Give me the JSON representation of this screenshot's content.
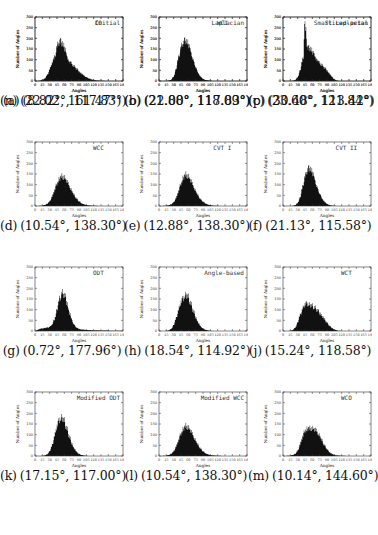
{
  "figure": {
    "axis": {
      "xlabel": "Angles",
      "ylabel": "Number of Angles",
      "xticks": [
        0,
        15,
        30,
        45,
        60,
        75,
        90,
        105,
        120,
        135,
        150,
        165,
        180
      ],
      "yticks": [
        0,
        50,
        100,
        150,
        200,
        250,
        300
      ],
      "xlim": [
        0,
        180
      ],
      "ylim": [
        0,
        300
      ]
    }
  },
  "chart_data": [
    {
      "type": "bar",
      "panel": "a",
      "title": "Initial",
      "caption": "(8.82°, 161.47°)",
      "label": "(a)",
      "values_text": "(8.82°, 161.47°)",
      "xlabel": "Angles",
      "ylabel": "Number of Angles",
      "xlim": [
        0,
        180
      ],
      "ylim": [
        0,
        300
      ],
      "x": [
        5,
        10,
        15,
        20,
        25,
        30,
        35,
        40,
        45,
        50,
        55,
        60,
        65,
        70,
        75,
        80,
        85,
        90,
        95,
        100,
        105,
        110,
        115,
        120,
        125,
        130,
        135,
        140,
        145,
        150,
        155,
        160
      ],
      "values": [
        0,
        2,
        5,
        12,
        28,
        55,
        85,
        105,
        118,
        120,
        115,
        110,
        100,
        92,
        82,
        70,
        58,
        45,
        35,
        26,
        18,
        12,
        8,
        5,
        3,
        2,
        1,
        1,
        0,
        0,
        0,
        0
      ]
    },
    {
      "type": "bar",
      "panel": "b",
      "title": "Laplacian",
      "caption": "(22.00°, 117.83°)",
      "label": "(b)",
      "xlabel": "Angles",
      "ylabel": "Number of Angles",
      "xlim": [
        0,
        180
      ],
      "ylim": [
        0,
        300
      ],
      "x": [
        20,
        25,
        30,
        35,
        40,
        45,
        50,
        55,
        60,
        65,
        70,
        75,
        80,
        85,
        90,
        95,
        100,
        105,
        110,
        115
      ],
      "values": [
        1,
        6,
        20,
        55,
        110,
        160,
        180,
        190,
        175,
        140,
        100,
        65,
        38,
        20,
        10,
        5,
        2,
        1,
        0,
        0
      ]
    },
    {
      "type": "bar",
      "panel": "c",
      "title": "Smart Laplacian",
      "caption": "(23.60°, 121.84°)",
      "label": "(c)",
      "xlabel": "Angles",
      "ylabel": "Number of Angles",
      "xlim": [
        0,
        180
      ],
      "ylim": [
        0,
        300
      ],
      "x": [
        20,
        25,
        30,
        35,
        40,
        45,
        50,
        55,
        60,
        65,
        70,
        75,
        80,
        85,
        90,
        95,
        100,
        105,
        110,
        115,
        120
      ],
      "values": [
        1,
        5,
        18,
        50,
        100,
        140,
        150,
        155,
        140,
        118,
        95,
        72,
        52,
        35,
        22,
        12,
        6,
        3,
        1,
        0,
        0
      ]
    },
    {
      "type": "bar",
      "panel": "d",
      "title": "WCC",
      "caption": "(10.54°, 138.30°)",
      "label": "(d)",
      "xlabel": "Angles",
      "ylabel": "Number of Angles",
      "xlim": [
        0,
        180
      ],
      "ylim": [
        0,
        300
      ],
      "x": [
        10,
        15,
        20,
        25,
        30,
        35,
        40,
        45,
        50,
        55,
        60,
        65,
        70,
        75,
        80,
        85,
        90,
        95,
        100,
        105,
        110,
        115,
        120,
        125,
        130,
        135
      ],
      "values": [
        1,
        2,
        5,
        10,
        22,
        45,
        75,
        105,
        128,
        140,
        135,
        118,
        95,
        72,
        52,
        35,
        22,
        13,
        8,
        5,
        3,
        2,
        1,
        1,
        0,
        0
      ]
    },
    {
      "type": "bar",
      "panel": "e",
      "title": "CVT I",
      "caption": "(12.88°, 138.30°)",
      "label": "(e)",
      "xlabel": "Angles",
      "ylabel": "Number of Angles",
      "xlim": [
        0,
        180
      ],
      "ylim": [
        0,
        300
      ],
      "x": [
        10,
        15,
        20,
        25,
        30,
        35,
        40,
        45,
        50,
        55,
        60,
        65,
        70,
        75,
        80,
        85,
        90,
        95,
        100,
        105,
        110,
        115,
        120,
        125,
        130,
        135
      ],
      "values": [
        1,
        2,
        4,
        8,
        18,
        38,
        70,
        105,
        135,
        148,
        140,
        120,
        95,
        70,
        50,
        32,
        20,
        12,
        7,
        4,
        2,
        1,
        1,
        0,
        0,
        0
      ]
    },
    {
      "type": "bar",
      "panel": "f",
      "title": "CVT II",
      "caption": "(21.13°, 115.58°)",
      "label": "(f)",
      "xlabel": "Angles",
      "ylabel": "Number of Angles",
      "xlim": [
        0,
        180
      ],
      "ylim": [
        0,
        300
      ],
      "x": [
        20,
        25,
        30,
        35,
        40,
        45,
        50,
        55,
        60,
        65,
        70,
        75,
        80,
        85,
        90,
        95,
        100,
        105,
        110,
        115
      ],
      "values": [
        1,
        4,
        14,
        40,
        90,
        140,
        168,
        178,
        160,
        125,
        88,
        58,
        35,
        20,
        10,
        5,
        2,
        1,
        0,
        0
      ]
    },
    {
      "type": "bar",
      "panel": "g",
      "title": "ODT",
      "caption": "(0.72°, 177.96°)",
      "label": "(g)",
      "xlabel": "Angles",
      "ylabel": "Number of Angles",
      "xlim": [
        0,
        180
      ],
      "ylim": [
        0,
        300
      ],
      "x": [
        5,
        10,
        15,
        20,
        25,
        30,
        35,
        40,
        45,
        50,
        55,
        60,
        65,
        70,
        75,
        80,
        85,
        90,
        95,
        100,
        105,
        110,
        115,
        120,
        125,
        130,
        135,
        140,
        145,
        150,
        155,
        160,
        165,
        170,
        175
      ],
      "values": [
        5,
        10,
        12,
        14,
        16,
        20,
        30,
        55,
        100,
        150,
        180,
        170,
        135,
        90,
        55,
        30,
        16,
        10,
        7,
        6,
        5,
        4,
        4,
        3,
        3,
        3,
        2,
        2,
        2,
        2,
        1,
        1,
        1,
        1,
        1
      ]
    },
    {
      "type": "bar",
      "panel": "h",
      "title": "Angle-based",
      "caption": "(18.54°, 114.92°)",
      "label": "(h)",
      "xlabel": "Angles",
      "ylabel": "Number of Angles",
      "xlim": [
        0,
        180
      ],
      "ylim": [
        0,
        300
      ],
      "x": [
        15,
        20,
        25,
        30,
        35,
        40,
        45,
        50,
        55,
        60,
        65,
        70,
        75,
        80,
        85,
        90,
        95,
        100,
        105,
        110,
        115
      ],
      "values": [
        1,
        3,
        10,
        28,
        60,
        100,
        135,
        155,
        170,
        160,
        130,
        95,
        65,
        40,
        22,
        12,
        6,
        3,
        1,
        0,
        0
      ]
    },
    {
      "type": "bar",
      "panel": "i",
      "title": "WCT",
      "caption": "(15.24°, 118.58°)",
      "label": "(j)",
      "xlabel": "Angles",
      "ylabel": "Number of Angles",
      "xlim": [
        0,
        180
      ],
      "ylim": [
        0,
        300
      ],
      "x": [
        15,
        20,
        25,
        30,
        35,
        40,
        45,
        50,
        55,
        60,
        65,
        70,
        75,
        80,
        85,
        90,
        95,
        100,
        105,
        110,
        115
      ],
      "values": [
        1,
        5,
        15,
        40,
        75,
        105,
        125,
        128,
        122,
        118,
        110,
        98,
        85,
        70,
        55,
        40,
        25,
        14,
        7,
        3,
        1
      ]
    },
    {
      "type": "bar",
      "panel": "k",
      "title": "Modified ODT",
      "caption": "(17.15°, 117.00°)",
      "label": "(k)",
      "xlabel": "Angles",
      "ylabel": "Number of Angles",
      "xlim": [
        0,
        180
      ],
      "ylim": [
        0,
        300
      ],
      "x": [
        15,
        20,
        25,
        30,
        35,
        40,
        45,
        50,
        55,
        60,
        65,
        70,
        75,
        80,
        85,
        90,
        95,
        100,
        105,
        110,
        115
      ],
      "values": [
        1,
        3,
        8,
        22,
        50,
        95,
        140,
        170,
        180,
        165,
        130,
        92,
        60,
        36,
        20,
        10,
        5,
        2,
        1,
        0,
        0
      ]
    },
    {
      "type": "bar",
      "panel": "l",
      "title": "Modified WCC",
      "caption": "(10.54°, 138.30°)",
      "label": "(l)",
      "xlabel": "Angles",
      "ylabel": "Number of Angles",
      "xlim": [
        0,
        180
      ],
      "ylim": [
        0,
        300
      ],
      "x": [
        10,
        15,
        20,
        25,
        30,
        35,
        40,
        45,
        50,
        55,
        60,
        65,
        70,
        75,
        80,
        85,
        90,
        95,
        100,
        105,
        110,
        115,
        120,
        125,
        130,
        135
      ],
      "values": [
        1,
        2,
        5,
        10,
        22,
        45,
        75,
        105,
        128,
        142,
        135,
        118,
        95,
        72,
        52,
        35,
        22,
        13,
        8,
        5,
        3,
        2,
        1,
        1,
        0,
        0
      ]
    },
    {
      "type": "bar",
      "panel": "m",
      "title": "WCO",
      "caption": "(10.14°, 144.60°)",
      "label": "(m)",
      "xlabel": "Angles",
      "ylabel": "Number of Angles",
      "xlim": [
        0,
        180
      ],
      "ylim": [
        0,
        300
      ],
      "x": [
        10,
        15,
        20,
        25,
        30,
        35,
        40,
        45,
        50,
        55,
        60,
        65,
        70,
        75,
        80,
        85,
        90,
        95,
        100,
        105,
        110,
        115,
        120,
        125,
        130,
        135,
        140
      ],
      "values": [
        1,
        2,
        5,
        10,
        25,
        55,
        90,
        118,
        128,
        130,
        130,
        125,
        112,
        95,
        72,
        50,
        32,
        18,
        10,
        5,
        3,
        2,
        1,
        1,
        0,
        0,
        0
      ]
    },
    {
      "type": "bar",
      "panel": "n",
      "title": "CO",
      "caption": "(22.02°, 117.83°)",
      "label": "(n)",
      "xlabel": "Angles",
      "ylabel": "Number of Angles",
      "xlim": [
        0,
        180
      ],
      "ylim": [
        0,
        300
      ],
      "x": [
        20,
        25,
        30,
        35,
        40,
        45,
        50,
        55,
        60,
        65,
        70,
        75,
        80,
        85,
        90,
        95,
        100,
        105,
        110,
        115
      ],
      "values": [
        1,
        6,
        20,
        55,
        110,
        165,
        185,
        180,
        160,
        120,
        85,
        55,
        32,
        18,
        9,
        4,
        2,
        1,
        0,
        0
      ]
    },
    {
      "type": "bar",
      "panel": "o",
      "title": "WCI",
      "caption": "(21.88°, 118.09°)",
      "label": "(o)",
      "xlabel": "Angles",
      "ylabel": "Number of Angles",
      "xlim": [
        0,
        180
      ],
      "ylim": [
        0,
        300
      ],
      "x": [
        20,
        25,
        30,
        35,
        40,
        45,
        50,
        55,
        60,
        65,
        70,
        75,
        80,
        85,
        90,
        95,
        100,
        105,
        110,
        115
      ],
      "values": [
        1,
        5,
        18,
        50,
        100,
        145,
        165,
        170,
        155,
        120,
        85,
        55,
        32,
        18,
        9,
        4,
        2,
        1,
        0,
        0
      ]
    },
    {
      "type": "bar",
      "panel": "p",
      "title": "Sliced-petal",
      "caption": "(30.48°, 113.42°)",
      "label": "(p)",
      "xlabel": "Angles",
      "ylabel": "Number of Angles",
      "xlim": [
        0,
        180
      ],
      "ylim": [
        0,
        300
      ],
      "x": [
        30,
        35,
        40,
        45,
        50,
        55,
        60,
        65,
        70,
        75,
        80,
        85,
        90,
        95,
        100,
        105,
        110,
        115
      ],
      "values": [
        2,
        10,
        35,
        280,
        150,
        120,
        110,
        105,
        95,
        85,
        75,
        62,
        50,
        35,
        20,
        8,
        2,
        0
      ]
    }
  ],
  "panels": [
    {
      "label": "(a)",
      "values": "(8.82°, 161.47°)"
    },
    {
      "label": "(b)",
      "values": "(22.00°, 117.83°)"
    },
    {
      "label": "(c)",
      "values": "(23.60°, 121.84°)"
    },
    {
      "label": "(d)",
      "values": "(10.54°, 138.30°)"
    },
    {
      "label": "(e)",
      "values": "(12.88°, 138.30°)"
    },
    {
      "label": "(f)",
      "values": "(21.13°, 115.58°)"
    },
    {
      "label": "(g)",
      "values": "(0.72°, 177.96°)"
    },
    {
      "label": "(h)",
      "values": "(18.54°, 114.92°)"
    },
    {
      "label": "(j)",
      "values": "(15.24°, 118.58°)"
    },
    {
      "label": "(k)",
      "values": "(17.15°, 117.00°)"
    },
    {
      "label": "(l)",
      "values": "(10.54°, 138.30°)"
    },
    {
      "label": "(m)",
      "values": "(10.14°, 144.60°)"
    },
    {
      "label": "(n)",
      "values": "(22.02°, 117.83°)"
    },
    {
      "label": "(o)",
      "values": "(21.88°, 118.09°)"
    },
    {
      "label": "(p)",
      "values": "(30.48°, 113.42°)"
    }
  ]
}
